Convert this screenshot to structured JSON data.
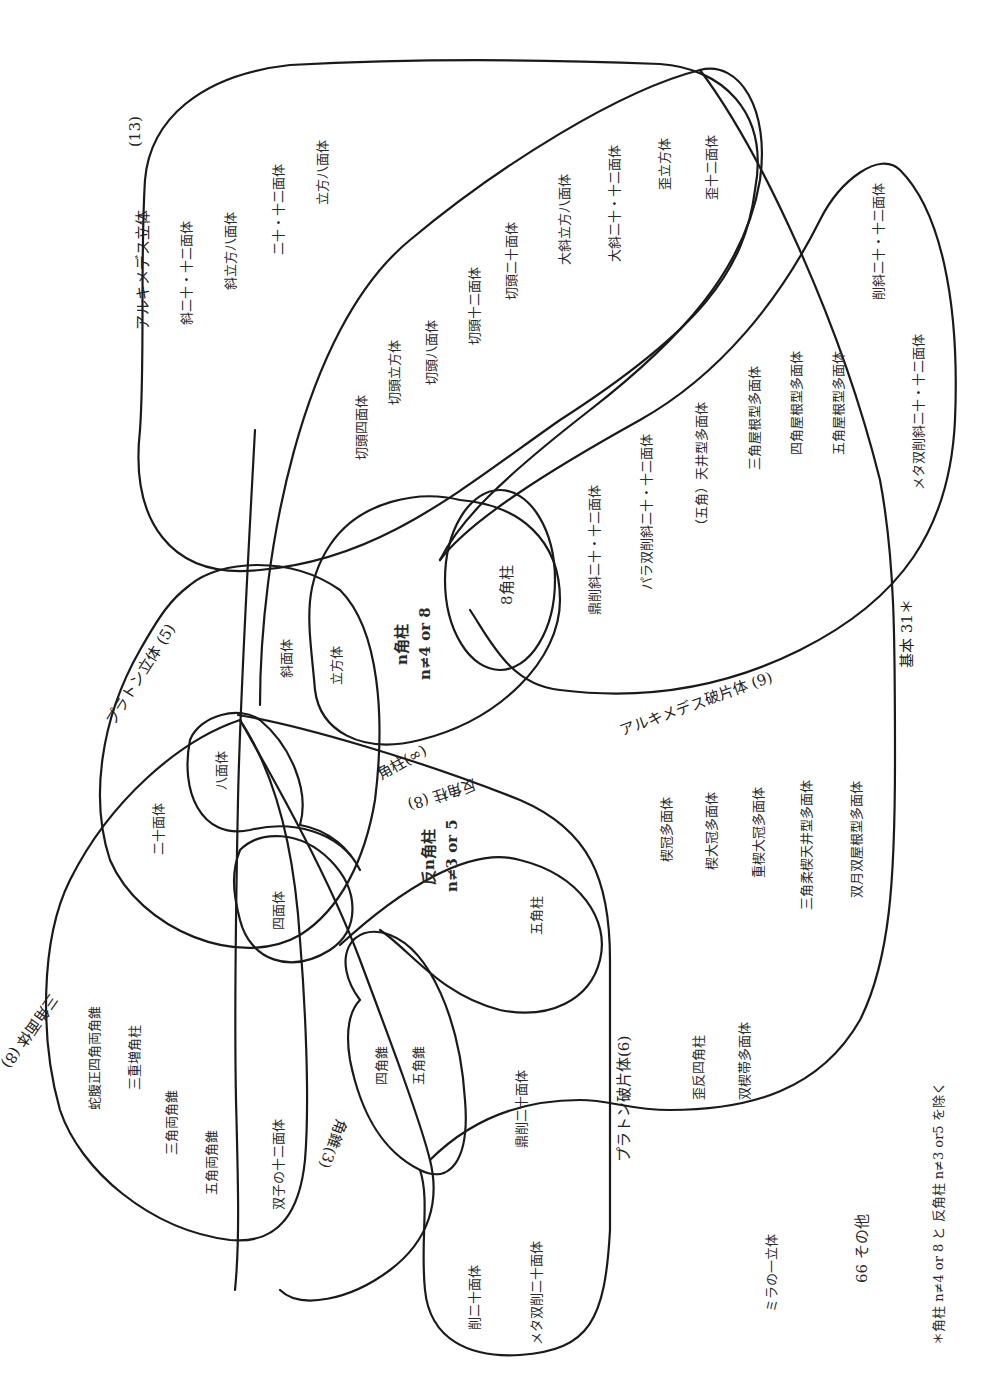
{
  "diagram": {
    "orientation": "rotated 90° counter-clockwise",
    "sets": {
      "archimedean": "アルキメデス立体",
      "archimedean_count": "(13)",
      "platonic": "プラトン立体 (5)",
      "prisms": "角柱(∞)",
      "antiprisms": "反角柱 (8)",
      "archimedean_fragments": "アルキメデス破片体 (9)",
      "platonic_fragments": "プラトン破片体(6)",
      "pyramids": "角錐(3)",
      "deltahedra": "三角面体 (8)",
      "basic": "基本 31＊"
    },
    "archimedean_items": [
      "斜二十・十二面体",
      "斜立方八面体",
      "二十・十二面体",
      "立方八面体",
      "切頭四面体",
      "切頭立方体",
      "切頭八面体",
      "切頭十二面体",
      "切頭二十面体",
      "大斜立方八面体",
      "大斜二十・十二面体",
      "歪立方体",
      "歪十二面体"
    ],
    "archimedean_fragment_items": [
      "削斜二十・十二面体",
      "メタ双削斜二十・十二面体",
      "三角屋根型多面体",
      "四角屋根型多面体",
      "五角屋根型多面体",
      "（五角）天井型多面体",
      "パラ双削斜二十・十二面体",
      "鼎削斜二十・十二面体"
    ],
    "prism_items": {
      "n_prism_line1": "n角柱",
      "n_prism_line2": "n≠4 or 8",
      "octagonal": "8角柱"
    },
    "platonic_items": {
      "rhombic": "斜面体",
      "cube": "立方体",
      "octahedron": "八面体",
      "icosahedron": "二十面体",
      "tetrahedron": "四面体"
    },
    "antiprism_items": {
      "line1": "反n角柱",
      "line2": "n≠3 or 5",
      "pentagonal_prism": "五角柱"
    },
    "basic_other_items": [
      "楔冠多面体",
      "楔大冠多面体",
      "重楔大冠多面体",
      "三角柔楔天井型多面体",
      "双月双屋根型多面体",
      "歪反四角柱",
      "双楔帯多面体"
    ],
    "deltahedra_items": [
      "蛇腹正四角両角錐",
      "三重増角柱",
      "三角両角錐",
      "五角両角錐",
      "双子の十二面体"
    ],
    "pyramid_items": [
      "四角錐",
      "五角錐"
    ],
    "fragment_items": [
      "鼎削二十面体",
      "削二十面体",
      "メタ双削二十面体"
    ],
    "outside": {
      "miller": "ミラの一立体",
      "other": "66 その他"
    },
    "footnote": "＊角柱 n≠4 or 8 と 反角柱 n≠3 or5 を除く",
    "stroke_color": "#1a1a1a",
    "background": "#ffffff"
  }
}
